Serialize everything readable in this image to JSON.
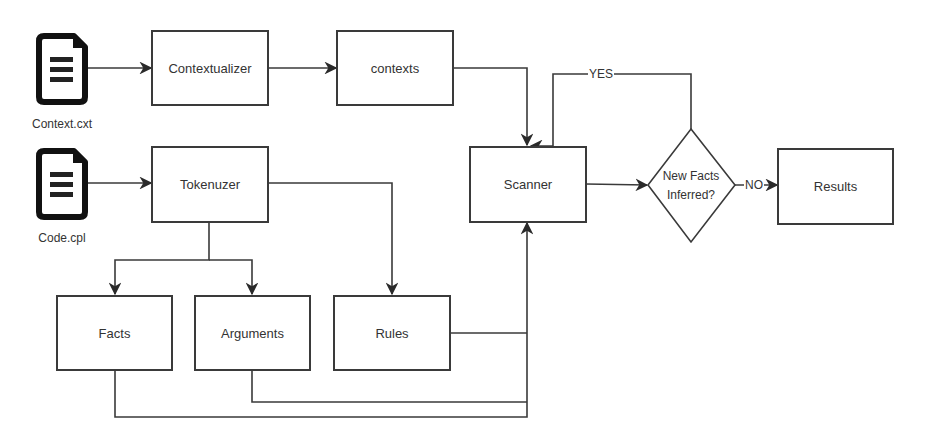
{
  "diagram": {
    "inputs": [
      {
        "id": "context-file",
        "icon": "document-icon",
        "label": "Context.cxt"
      },
      {
        "id": "code-file",
        "icon": "document-icon",
        "label": "Code.cpl"
      }
    ],
    "nodes": {
      "contextualizer": "Contextualizer",
      "contexts": "contexts",
      "tokenizer": "Tokenuzer",
      "scanner": "Scanner",
      "facts": "Facts",
      "arguments": "Arguments",
      "rules": "Rules",
      "decision_line1": "New Facts",
      "decision_line2": "Inferred?",
      "results": "Results"
    },
    "edge_labels": {
      "yes": "YES",
      "no": "NO"
    },
    "edges": [
      [
        "Context.cxt",
        "Contextualizer"
      ],
      [
        "Contextualizer",
        "contexts"
      ],
      [
        "contexts",
        "Scanner"
      ],
      [
        "Code.cpl",
        "Tokenuzer"
      ],
      [
        "Tokenuzer",
        "Facts"
      ],
      [
        "Tokenuzer",
        "Arguments"
      ],
      [
        "Tokenuzer",
        "Rules"
      ],
      [
        "Rules",
        "Scanner"
      ],
      [
        "Arguments",
        "Scanner"
      ],
      [
        "Facts",
        "Scanner"
      ],
      [
        "Scanner",
        "New Facts Inferred?"
      ],
      [
        "New Facts Inferred?",
        "Scanner",
        "YES"
      ],
      [
        "New Facts Inferred?",
        "Results",
        "NO"
      ]
    ],
    "colors": {
      "stroke": "#3a3a3a",
      "background": "#ffffff",
      "text": "#333333"
    }
  }
}
